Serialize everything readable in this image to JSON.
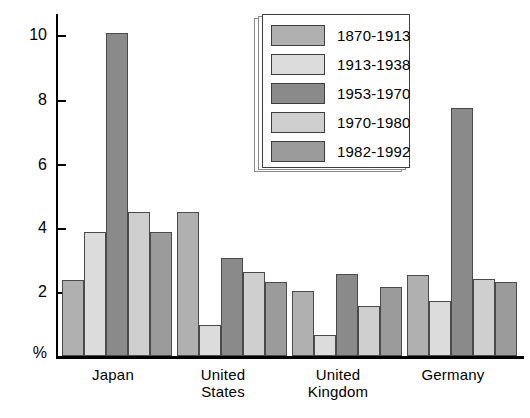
{
  "chart_data": {
    "type": "bar",
    "title": "",
    "xlabel": "",
    "ylabel": "%",
    "ylim": [
      0,
      10.6
    ],
    "yticks": [
      2,
      4,
      6,
      8,
      10
    ],
    "ytick_labels": [
      "2",
      "4",
      "6",
      "8",
      "10"
    ],
    "grid": false,
    "legend_position": "top-center-right",
    "categories": [
      "Japan",
      "United States",
      "United Kingdom",
      "Germany"
    ],
    "category_labels": [
      [
        "Japan"
      ],
      [
        "United",
        "States"
      ],
      [
        "United",
        "Kingdom"
      ],
      [
        "Germany"
      ]
    ],
    "series": [
      {
        "name": "1870-1913",
        "color": "#b0b0b0",
        "values": [
          2.35,
          4.45,
          2.0,
          2.5
        ]
      },
      {
        "name": "1913-1938",
        "color": "#dcdcdc",
        "values": [
          3.85,
          0.95,
          0.65,
          1.7
        ]
      },
      {
        "name": "1953-1970",
        "color": "#8a8a8a",
        "values": [
          10.0,
          3.05,
          2.55,
          7.7
        ]
      },
      {
        "name": "1970-1980",
        "color": "#cfcfcf",
        "values": [
          4.45,
          2.6,
          1.55,
          2.4
        ]
      },
      {
        "name": "1982-1992",
        "color": "#9b9b9b",
        "values": [
          3.85,
          2.3,
          2.15,
          2.3
        ]
      }
    ]
  },
  "legend": {
    "items": [
      {
        "label": "1870-1913",
        "swatch": "#b0b0b0"
      },
      {
        "label": "1913-1938",
        "swatch": "#dcdcdc"
      },
      {
        "label": "1953-1970",
        "swatch": "#8a8a8a"
      },
      {
        "label": "1970-1980",
        "swatch": "#cfcfcf"
      },
      {
        "label": "1982-1992",
        "swatch": "#9b9b9b"
      }
    ]
  },
  "axis": {
    "y_unit_label": "%",
    "tick_labels": [
      "10",
      "8",
      "6",
      "4",
      "2"
    ]
  }
}
